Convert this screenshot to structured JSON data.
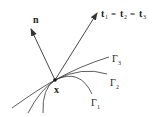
{
  "diagram": {
    "labels": {
      "normal": "n",
      "tangent_t": "t",
      "tangent_subs": [
        "1",
        "2",
        "3"
      ],
      "equals": "=",
      "point": "x",
      "gamma": "Γ",
      "curve_subs": [
        "3",
        "2",
        "1"
      ]
    },
    "colors": {
      "stroke": "#333333",
      "text": "#222222"
    }
  }
}
